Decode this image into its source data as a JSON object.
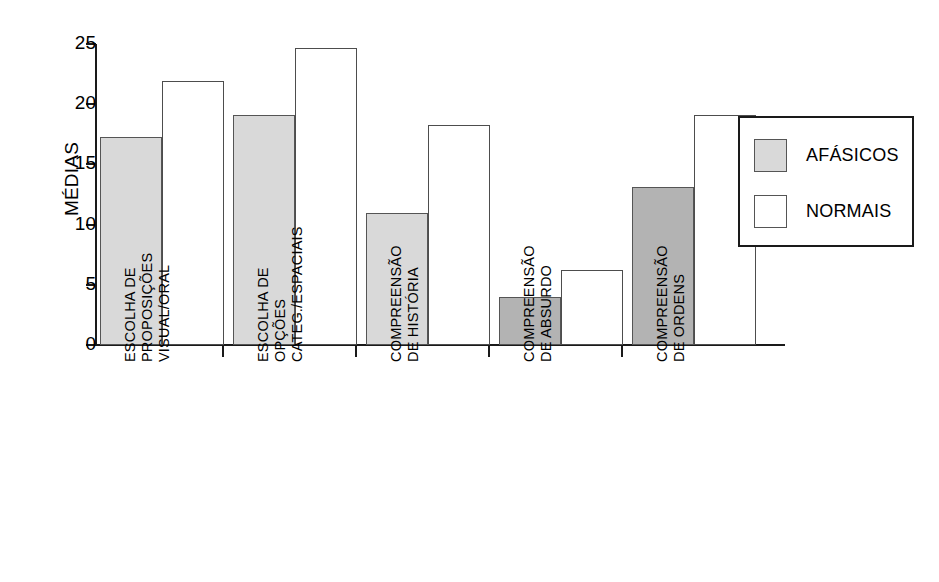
{
  "chart_data": {
    "type": "bar",
    "title": "",
    "xlabel": "",
    "ylabel": "MÉDIAS",
    "ylim": [
      0,
      25
    ],
    "yticks": [
      0,
      5,
      10,
      15,
      20,
      25
    ],
    "ytick_labels": [
      "0",
      "5",
      "10",
      "15",
      "20",
      "25"
    ],
    "grid": false,
    "legend_position": "right",
    "categories": [
      "ESCOLHA DE\nPROPOSIÇÕES\nVISUAL/ORAL",
      "ESCOLHA DE\nOPÇÕES\nCATEG./ESPACIAIS",
      "COMPREENSÃO\nDE HISTÓRIA",
      "COMPREENSÃO\nDE ABSURDO",
      "COMPREENSÃO\nDE ORDENS"
    ],
    "series": [
      {
        "name": "AFÁSICOS",
        "color": "#d9d9d9",
        "values": [
          17.3,
          19.1,
          11.0,
          4.0,
          13.1
        ]
      },
      {
        "name": "NORMAIS",
        "color": "#ffffff",
        "values": [
          21.9,
          24.7,
          18.3,
          6.2,
          19.1
        ]
      }
    ]
  },
  "legend": {
    "items": [
      {
        "label": "AFÁSICOS",
        "swatch_color": "#d9d9d9"
      },
      {
        "label": "NORMAIS",
        "swatch_color": "#ffffff"
      }
    ]
  },
  "axis": {
    "y_title": "MÉDIAS"
  },
  "colors": {
    "bar_gray_light": "#d9d9d9",
    "bar_gray_dark": "#b3b3b3",
    "bar_white": "#ffffff",
    "bar_outline": "#555555",
    "axis": "#1a1a1a"
  }
}
